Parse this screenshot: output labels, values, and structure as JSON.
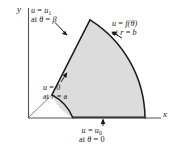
{
  "figure": {
    "type": "annular-sector-boundary-value-diagram",
    "background_color": "#ffffff",
    "region_fill_color": "#dcdcdc",
    "outline_color": "#1a1a1a",
    "axes": {
      "x_label": "x",
      "y_label": "y",
      "origin": {
        "x": 28,
        "y": 118
      }
    },
    "geometry": {
      "inner_radius_name": "a",
      "outer_radius_name": "b",
      "angle_name": "β",
      "inner_radius_px": 45,
      "outer_radius_px": 117,
      "angle_deg": 58
    },
    "labels": {
      "upper_radial": {
        "line1_lhs": "u",
        "line1_eq": "=",
        "line1_rhs": "u",
        "line1_rhs_sub": "1",
        "line2_prefix": "at",
        "line2_lhs": "θ",
        "line2_eq": "=",
        "line2_rhs": "β"
      },
      "outer_arc": {
        "line1_lhs": "u",
        "line1_eq": "=",
        "line1_rhs": "f(θ)",
        "line2_prefix": "at",
        "line2_lhs": "r",
        "line2_eq": "=",
        "line2_rhs": "b"
      },
      "inner_arc": {
        "line1_lhs": "u",
        "line1_eq": "=",
        "line1_rhs": "0",
        "line2_prefix": "at",
        "line2_lhs": "r",
        "line2_eq": "=",
        "line2_rhs": "a"
      },
      "lower_radial": {
        "line1_lhs": "u",
        "line1_eq": "=",
        "line1_rhs": "u",
        "line1_rhs_sub": "0",
        "line2_prefix": "at",
        "line2_lhs": "θ",
        "line2_eq": "=",
        "line2_rhs": "0"
      }
    }
  }
}
